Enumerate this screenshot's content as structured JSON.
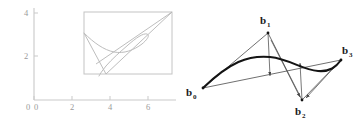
{
  "figure": {
    "caption": "",
    "background_color": "#ffffff",
    "panels": [
      "left-plot",
      "right-bezier-diagram"
    ]
  },
  "left_plot": {
    "name": "faint-line-plot",
    "axis_color": "#c9c9c9",
    "line_color": "#b0b0b0",
    "frame_color": "#c4c4c4",
    "origin_label": "0",
    "x_axis": {
      "label": "",
      "ticks": [
        "0",
        "2",
        "4",
        "6"
      ],
      "tick_values": [
        0,
        2,
        4,
        6
      ],
      "range": [
        0,
        7.4
      ]
    },
    "y_axis": {
      "label": "",
      "ticks": [
        "2",
        "4"
      ],
      "tick_values": [
        2,
        4
      ],
      "range": [
        0,
        4.4
      ]
    },
    "frame_rect": {
      "x0": 3.0,
      "y0": 1.05,
      "x1": 7.15,
      "y1": 4.05
    },
    "control_polygon": {
      "points": [
        [
          3.0,
          3.0
        ],
        [
          5.0,
          1.05
        ],
        [
          7.15,
          4.05
        ],
        [
          3.55,
          1.55
        ]
      ]
    },
    "curve_points": [
      [
        3.0,
        3.0
      ],
      [
        3.5,
        2.6
      ],
      [
        4.0,
        2.35
      ],
      [
        4.45,
        2.28
      ],
      [
        4.9,
        2.38
      ],
      [
        5.3,
        2.58
      ],
      [
        5.6,
        2.78
      ],
      [
        5.75,
        2.9
      ],
      [
        5.72,
        2.95
      ],
      [
        5.5,
        2.92
      ],
      [
        5.15,
        2.78
      ],
      [
        4.8,
        2.58
      ],
      [
        4.5,
        2.38
      ],
      [
        4.3,
        2.2
      ],
      [
        4.2,
        2.05
      ]
    ]
  },
  "right_plot": {
    "name": "bezier-de-casteljau-diagram",
    "curve_color": "#1a1a1a",
    "polygon_color": "#4a4a4a",
    "helper_color": "#555555",
    "curve_type": "cubic-bezier",
    "labels": {
      "b0": {
        "base": "b",
        "sub": "0"
      },
      "b1": {
        "base": "b",
        "sub": "1"
      },
      "b2": {
        "base": "b",
        "sub": "2"
      },
      "b3": {
        "base": "b",
        "sub": "3"
      }
    },
    "control_points": {
      "b0": [
        25,
        88
      ],
      "b1": [
        90,
        33
      ],
      "b2": [
        124,
        100
      ],
      "b3": [
        163,
        60
      ]
    },
    "label_positions": {
      "b0": [
        10,
        94
      ],
      "b1": [
        84,
        22
      ],
      "b2": [
        120,
        113
      ],
      "b3": [
        166,
        55
      ]
    },
    "curve_points": [
      [
        25,
        88
      ],
      [
        36,
        77
      ],
      [
        48,
        69
      ],
      [
        60,
        63
      ],
      [
        72,
        59
      ],
      [
        84,
        57
      ],
      [
        96,
        57
      ],
      [
        108,
        60
      ],
      [
        120,
        65
      ],
      [
        132,
        70
      ],
      [
        144,
        71
      ],
      [
        154,
        68
      ],
      [
        163,
        60
      ]
    ],
    "helper_arrows": [
      {
        "from": [
          90,
          33
        ],
        "to": [
          92,
          74
        ],
        "name": "arrow-b1-down"
      },
      {
        "from": [
          124,
          100
        ],
        "to": [
          122,
          66
        ],
        "name": "arrow-b2-up"
      },
      {
        "from": [
          90,
          33
        ],
        "to": [
          124,
          100
        ],
        "name": "arrow-b1-b2"
      },
      {
        "from": [
          163,
          60
        ],
        "to": [
          124,
          100
        ],
        "name": "arrow-b3-b2"
      }
    ]
  }
}
